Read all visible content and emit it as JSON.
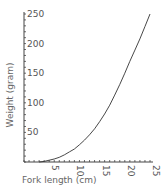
{
  "chart_data": {
    "type": "line",
    "title": "",
    "xlabel": "Fork length (cm)",
    "ylabel": "Weight (gram)",
    "xlim": [
      0,
      25
    ],
    "ylim": [
      0,
      250
    ],
    "x_ticks": [
      5,
      10,
      15,
      20,
      25
    ],
    "y_ticks": [
      50,
      100,
      150,
      200,
      250
    ],
    "grid": false,
    "legend": null,
    "series": [
      {
        "name": "Length-weight relationship",
        "x": [
          3,
          4,
          5,
          6,
          7,
          8,
          9,
          10,
          11,
          12,
          13,
          14,
          15,
          16,
          17,
          18,
          19,
          20,
          21,
          22,
          23,
          24,
          25
        ],
        "values": [
          0,
          1,
          3,
          5,
          8,
          12,
          17,
          22,
          29,
          37,
          46,
          56,
          68,
          81,
          96,
          113,
          131,
          150,
          170,
          189,
          208,
          229,
          250
        ]
      }
    ],
    "x_tick_rotation": 90,
    "minor_ticks": true
  },
  "colors": {
    "axis": "#444444",
    "line": "#333333",
    "text": "#555555"
  }
}
